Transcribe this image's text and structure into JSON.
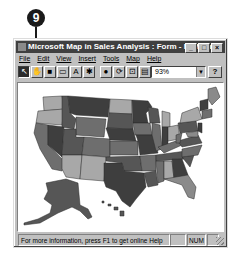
{
  "callout": {
    "number": "9"
  },
  "window": {
    "title": "Microsoft Map in Sales Analysis : Form - MSMap",
    "controls": {
      "minimize": "_",
      "maximize": "□",
      "close": "×"
    }
  },
  "menu": [
    "File",
    "Edit",
    "View",
    "Insert",
    "Tools",
    "Map",
    "Help"
  ],
  "toolbar": {
    "tools": [
      {
        "name": "select-tool",
        "glyph": "↖",
        "pressed": true
      },
      {
        "name": "grabber-tool",
        "glyph": "✋",
        "pressed": false
      },
      {
        "name": "center-map-tool",
        "glyph": "■",
        "pressed": false
      },
      {
        "name": "map-labels-tool",
        "glyph": "▭",
        "pressed": false
      },
      {
        "name": "add-text-tool",
        "glyph": "A",
        "pressed": false
      },
      {
        "name": "custom-pin-tool",
        "glyph": "✱",
        "pressed": false
      },
      {
        "name": "display-entire-tool",
        "glyph": "●",
        "pressed": false
      },
      {
        "name": "redraw-map-tool",
        "glyph": "⟳",
        "pressed": false
      },
      {
        "name": "map-refresh-tool",
        "glyph": "⊡",
        "pressed": false
      },
      {
        "name": "show-control-tool",
        "glyph": "▤",
        "pressed": false
      }
    ],
    "zoom_value": "93%",
    "help_glyph": "?"
  },
  "map": {
    "legend": "United States map, states shaded in grayscale by sales value",
    "shades": {
      "light": "#a8a8a8",
      "medium_light": "#8a8a8a",
      "medium": "#6e6e6e",
      "medium_dark": "#565656",
      "dark": "#3e3e3e",
      "border": "#2a2a2a"
    }
  },
  "status": {
    "message": "For more information, press F1 to get online Help",
    "cells": [
      "",
      "NUM",
      ""
    ]
  }
}
